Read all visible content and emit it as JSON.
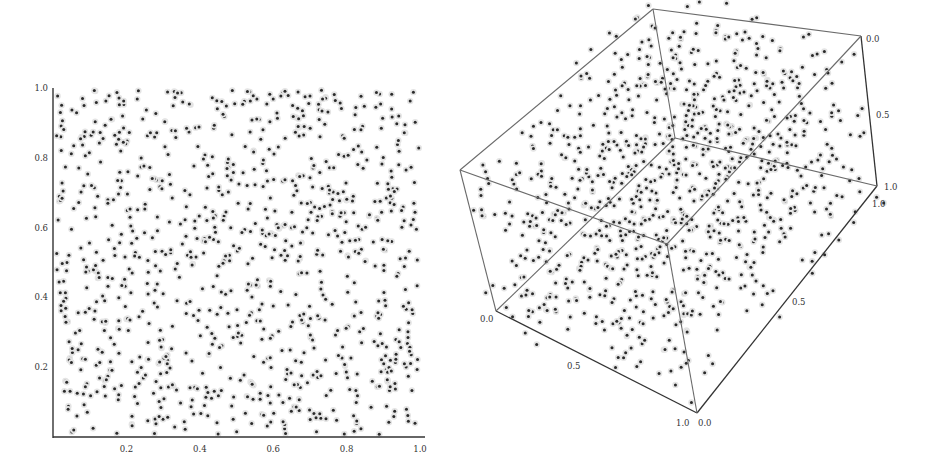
{
  "chart_data": [
    {
      "type": "scatter",
      "title": "",
      "description": "2D uniform point set in the unit square",
      "xlabel": "",
      "ylabel": "",
      "xlim": [
        0,
        1
      ],
      "ylim": [
        0,
        1
      ],
      "x_ticks": [
        "0.2",
        "0.4",
        "0.6",
        "0.8",
        "1.0"
      ],
      "y_ticks": [
        "0.2",
        "0.4",
        "0.6",
        "0.8",
        "1.0"
      ],
      "grid": false,
      "legend": null,
      "approx_point_count": 1000,
      "point_color": "#2a2a2a"
    },
    {
      "type": "scatter3d",
      "title": "",
      "description": "3D uniform point set in the unit cube, shown in a boxed perspective view",
      "xlim": [
        0,
        1
      ],
      "ylim": [
        0,
        1
      ],
      "zlim": [
        0,
        1
      ],
      "axis_labels": {
        "left_edge": [
          "0.0",
          "0.5",
          "1.0"
        ],
        "bottom_right_edge": [
          "0.0",
          "0.5",
          "1.0"
        ],
        "right_edge": [
          "0.0",
          "0.5",
          "1.0"
        ]
      },
      "grid": false,
      "legend": null,
      "approx_point_count": 1000,
      "point_color": "#2a2a2a"
    }
  ],
  "plot2d": {
    "x_ticks": [
      {
        "label": "0.2",
        "value": 0.2
      },
      {
        "label": "0.4",
        "value": 0.4
      },
      {
        "label": "0.6",
        "value": 0.6
      },
      {
        "label": "0.8",
        "value": 0.8
      },
      {
        "label": "1.0",
        "value": 1.0
      }
    ],
    "y_ticks": [
      {
        "label": "0.2",
        "value": 0.2
      },
      {
        "label": "0.4",
        "value": 0.4
      },
      {
        "label": "0.6",
        "value": 0.6
      },
      {
        "label": "0.8",
        "value": 0.8
      },
      {
        "label": "1.0",
        "value": 1.0
      }
    ]
  },
  "plot3d": {
    "labels": [
      {
        "text": "0.0",
        "x": 480,
        "y": 322
      },
      {
        "text": "0.5",
        "x": 567,
        "y": 369
      },
      {
        "text": "1.0",
        "x": 676,
        "y": 426
      },
      {
        "text": "0.0",
        "x": 698,
        "y": 426
      },
      {
        "text": "0.5",
        "x": 792,
        "y": 305
      },
      {
        "text": "1.0",
        "x": 872,
        "y": 207
      },
      {
        "text": "1.0",
        "x": 884,
        "y": 190
      },
      {
        "text": "0.5",
        "x": 876,
        "y": 118
      },
      {
        "text": "0.0",
        "x": 866,
        "y": 42
      }
    ]
  },
  "colors": {
    "axis": "#333333",
    "box": "#6a6a6a",
    "point": "#2a2a2a",
    "halo": "#e4e4e4"
  }
}
